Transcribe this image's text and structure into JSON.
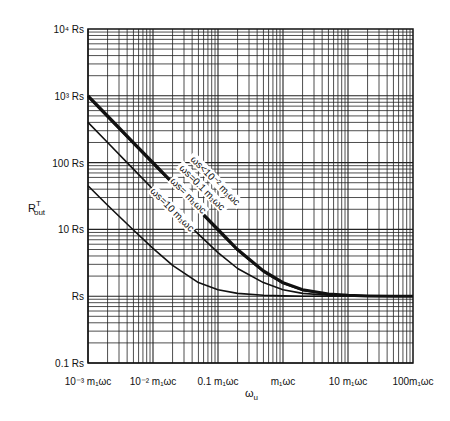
{
  "chart_data": {
    "type": "line",
    "title": "",
    "xlabel": "ω_u",
    "ylabel": "R^T_out",
    "xscale": "log",
    "yscale": "log",
    "xlim": [
      0.001,
      100
    ],
    "ylim": [
      0.1,
      10000
    ],
    "grid": true,
    "legend": "inline labels along curves",
    "x_ticks": [
      {
        "value": 0.001,
        "label": "10⁻³ m₁ωc"
      },
      {
        "value": 0.01,
        "label": "10⁻² m₁ωc"
      },
      {
        "value": 0.1,
        "label": "0.1 m₁ωc"
      },
      {
        "value": 1,
        "label": "m₁ωc"
      },
      {
        "value": 10,
        "label": "10 m₁ωc"
      },
      {
        "value": 100,
        "label": "100m₁ωc"
      }
    ],
    "y_ticks": [
      {
        "value": 0.1,
        "label": "0.1 Rs"
      },
      {
        "value": 1,
        "label": "Rs"
      },
      {
        "value": 10,
        "label": "10 Rs"
      },
      {
        "value": 100,
        "label": "100 Rs"
      },
      {
        "value": 1000,
        "label": "10³ Rs"
      },
      {
        "value": 10000,
        "label": "10⁴ Rs"
      }
    ],
    "x": [
      0.001,
      0.002,
      0.005,
      0.01,
      0.02,
      0.05,
      0.1,
      0.2,
      0.5,
      1,
      2,
      5,
      10,
      20,
      50,
      100
    ],
    "series": [
      {
        "name": "ωs < 10⁻² m₁ωc",
        "values": [
          1000,
          500,
          200,
          100,
          50,
          20,
          10,
          5,
          2.4,
          1.6,
          1.25,
          1.08,
          1.03,
          1.01,
          1,
          1
        ],
        "weight": "thick"
      },
      {
        "name": "ωs = 0.1 m₁ωc",
        "values": [
          950,
          475,
          190,
          95,
          48,
          19,
          9.5,
          4.8,
          2.3,
          1.55,
          1.22,
          1.07,
          1.03,
          1.01,
          1,
          1
        ],
        "weight": "normal"
      },
      {
        "name": "ωs = m₁ωc",
        "values": [
          400,
          200,
          80,
          40,
          20,
          8.5,
          4.5,
          2.6,
          1.6,
          1.25,
          1.1,
          1.03,
          1.01,
          1,
          1,
          1
        ],
        "weight": "normal"
      },
      {
        "name": "ωs = 10 m₁ωc",
        "values": [
          45,
          23,
          9.8,
          5.2,
          2.9,
          1.6,
          1.25,
          1.1,
          1.03,
          1.01,
          1,
          1,
          1,
          1,
          1,
          1
        ],
        "weight": "normal"
      }
    ]
  },
  "labels": {
    "y_axis": "R",
    "y_axis_sup": "T",
    "y_axis_sub": "out",
    "x_axis": "ω",
    "x_axis_sub": "u",
    "curve_labels": [
      "ωs<10⁻² m₁ωc",
      "ωs=0.1 m₁ωc",
      "ωs= m₁ωc",
      "ωs=10 m₁ωc"
    ]
  }
}
